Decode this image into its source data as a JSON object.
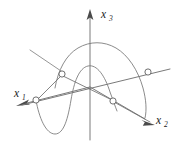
{
  "figure": {
    "background_color": "#ffffff",
    "stroke_color": "#6b6b6b",
    "label_color": "#1a1a1a",
    "marker_fill": "#ffffff",
    "width": 177,
    "height": 149
  },
  "axes": [
    {
      "name": "x1",
      "label_base": "x",
      "label_sub": "1",
      "label_x": 14,
      "label_y": 97,
      "sub_dx": 8,
      "sub_dy": 3,
      "direction": "lower-left",
      "arrow": "filled-triangle"
    },
    {
      "name": "x2",
      "label_base": "x",
      "label_sub": "2",
      "label_x": 156,
      "label_y": 124,
      "sub_dx": 8,
      "sub_dy": 3,
      "direction": "lower-right",
      "arrow": "filled-triangle"
    },
    {
      "name": "x3",
      "label_base": "x",
      "label_sub": "3",
      "label_x": 101,
      "label_y": 18,
      "sub_dx": 8,
      "sub_dy": 3,
      "direction": "up",
      "arrow": "filled-triangle"
    }
  ],
  "nodes": [
    {
      "name": "node-left-on-x1",
      "cx": 36,
      "cy": 100,
      "r": 3.1
    },
    {
      "name": "node-upper-left-peak",
      "cx": 62,
      "cy": 74,
      "r": 3.1
    },
    {
      "name": "node-lower-right-on-x2",
      "cx": 113,
      "cy": 101,
      "r": 3.1
    },
    {
      "name": "node-right-on-x2",
      "cx": 148,
      "cy": 72,
      "r": 3.1
    }
  ],
  "curves": [
    {
      "name": "front-sine-curve",
      "description": "Sinusoid crossing the x1-x2 plane, trough at lower left, crest near center"
    },
    {
      "name": "back-sine-curve",
      "description": "Sinusoid behind the x3 axis, crest upper right, trough lower right"
    }
  ],
  "segments": [
    {
      "name": "chord-left-to-peak",
      "description": "Line from left node to upper-left peak node"
    },
    {
      "name": "chord-peak-to-lower-right",
      "description": "Line from peak node down to lower-right node"
    },
    {
      "name": "tangent-upper-left",
      "description": "Short diagonal tangent line at upper left"
    }
  ]
}
